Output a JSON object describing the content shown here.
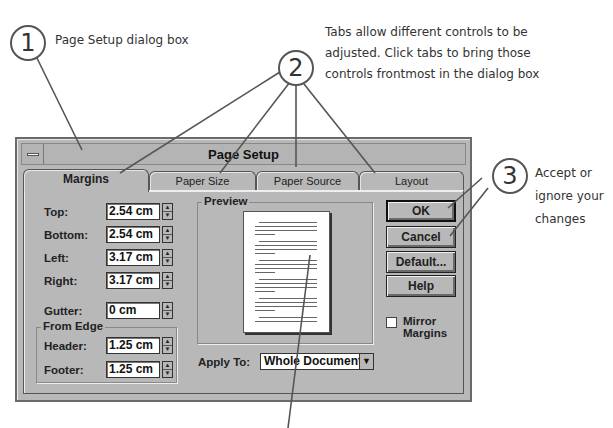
{
  "callouts": [
    {
      "number": "1",
      "text": "Page Setup dialog box"
    },
    {
      "number": "2",
      "text_lines": [
        "Tabs allow different controls to be",
        "adjusted. Click tabs to bring those",
        "controls frontmost in the dialog box"
      ]
    },
    {
      "number": "3",
      "text_lines": [
        "Accept or",
        "ignore your",
        "changes"
      ]
    }
  ],
  "dialog": {
    "title": "Page Setup",
    "tabs": [
      {
        "label": "Margins",
        "active": true
      },
      {
        "label": "Paper Size",
        "active": false
      },
      {
        "label": "Paper Source",
        "active": false
      },
      {
        "label": "Layout",
        "active": false
      }
    ],
    "margins": {
      "top": {
        "label": "Top:",
        "value": "2.54 cm"
      },
      "bottom": {
        "label": "Bottom:",
        "value": "2.54 cm"
      },
      "left": {
        "label": "Left:",
        "value": "3.17 cm"
      },
      "right": {
        "label": "Right:",
        "value": "3.17 cm"
      },
      "gutter": {
        "label": "Gutter:",
        "value": "0 cm"
      }
    },
    "from_edge": {
      "label": "From Edge",
      "header": {
        "label": "Header:",
        "value": "1.25 cm"
      },
      "footer": {
        "label": "Footer:",
        "value": "1.25 cm"
      }
    },
    "preview": {
      "label": "Preview"
    },
    "apply_to": {
      "label": "Apply To:",
      "value": "Whole Document"
    },
    "buttons": {
      "ok": "OK",
      "cancel": "Cancel",
      "default": "Default...",
      "help": "Help"
    },
    "mirror_margins": {
      "label_line1": "Mirror",
      "label_line2": "Margins",
      "checked": false
    },
    "spinner_up": "▲",
    "spinner_down": "▼",
    "dropdown_arrow": "▼"
  }
}
